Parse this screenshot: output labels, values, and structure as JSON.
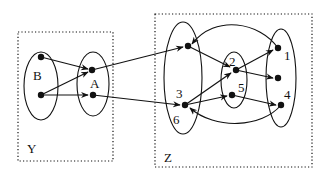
{
  "diagram": {
    "title": "",
    "colors": {
      "stroke": "#111111",
      "background": "#ffffff"
    },
    "boxes": [
      {
        "id": "Y",
        "label": "Y",
        "x": 18,
        "y": 32,
        "w": 95,
        "h": 129,
        "style": "dotted",
        "label_x": 27,
        "label_y": 153
      },
      {
        "id": "Z",
        "label": "Z",
        "x": 155,
        "y": 14,
        "w": 157,
        "h": 153,
        "style": "dotted",
        "label_x": 164,
        "label_y": 162
      }
    ],
    "ellipses": [
      {
        "id": "B",
        "label": "B",
        "cx": 41,
        "cy": 86,
        "rx": 17,
        "ry": 34,
        "label_x": 33,
        "label_y": 80
      },
      {
        "id": "A",
        "label": "A",
        "cx": 93,
        "cy": 84,
        "rx": 16,
        "ry": 32,
        "label_x": 90,
        "label_y": 88
      },
      {
        "id": "Z36",
        "label": "",
        "cx": 183,
        "cy": 78,
        "rx": 19,
        "ry": 56
      },
      {
        "id": "Z25",
        "label": "",
        "cx": 234,
        "cy": 80,
        "rx": 13,
        "ry": 28
      },
      {
        "id": "Z14",
        "label": "",
        "cx": 281,
        "cy": 78,
        "rx": 15,
        "ry": 49
      }
    ],
    "nodes": [
      {
        "id": "b1",
        "x": 41,
        "y": 57
      },
      {
        "id": "b2",
        "x": 41,
        "y": 95
      },
      {
        "id": "a1",
        "x": 92,
        "y": 70
      },
      {
        "id": "a2",
        "x": 93,
        "y": 95
      },
      {
        "id": "z_top",
        "x": 188,
        "y": 46
      },
      {
        "id": "z36",
        "x": 185,
        "y": 105
      },
      {
        "id": "z2",
        "x": 236,
        "y": 70
      },
      {
        "id": "z5",
        "x": 232,
        "y": 95
      },
      {
        "id": "z1",
        "x": 278,
        "y": 48
      },
      {
        "id": "z_mid",
        "x": 278,
        "y": 78
      },
      {
        "id": "z4",
        "x": 281,
        "y": 105
      }
    ],
    "node_labels": [
      {
        "text": "3",
        "x": 176,
        "y": 98
      },
      {
        "text": "6",
        "x": 173,
        "y": 124
      },
      {
        "text": "2",
        "x": 229,
        "y": 66
      },
      {
        "text": "5",
        "x": 238,
        "y": 92
      },
      {
        "text": "1",
        "x": 284,
        "y": 60
      },
      {
        "text": "4",
        "x": 284,
        "y": 99
      }
    ],
    "edges": [
      {
        "from": "b1",
        "to": "a1",
        "path": "M41,57 L88,69"
      },
      {
        "from": "b2",
        "to": "a1",
        "path": "M41,95 L88,72"
      },
      {
        "from": "b2",
        "to": "a2",
        "path": "M41,95 L88,95"
      },
      {
        "from": "a1",
        "to": "z_top",
        "path": "M92,70 L183,47"
      },
      {
        "from": "a2",
        "to": "z36",
        "path": "M93,95 L180,105"
      },
      {
        "from": "z_top",
        "to": "z2",
        "path": "M188,46 L230,67"
      },
      {
        "from": "z36",
        "to": "z2",
        "path": "M185,105 L231,73"
      },
      {
        "from": "z36",
        "to": "z5",
        "path": "M185,105 L227,96"
      },
      {
        "from": "z2",
        "to": "z1",
        "path": "M236,70 L273,50"
      },
      {
        "from": "z2",
        "to": "z_mid",
        "path": "M236,70 L273,78"
      },
      {
        "from": "z5",
        "to": "z4",
        "path": "M232,95 L276,105"
      },
      {
        "from": "z1",
        "to": "z_top",
        "path": "M278,48 C260,22 215,14 192,44"
      },
      {
        "from": "z4",
        "to": "z36",
        "path": "M281,105 C262,128 215,130 190,108"
      }
    ]
  }
}
